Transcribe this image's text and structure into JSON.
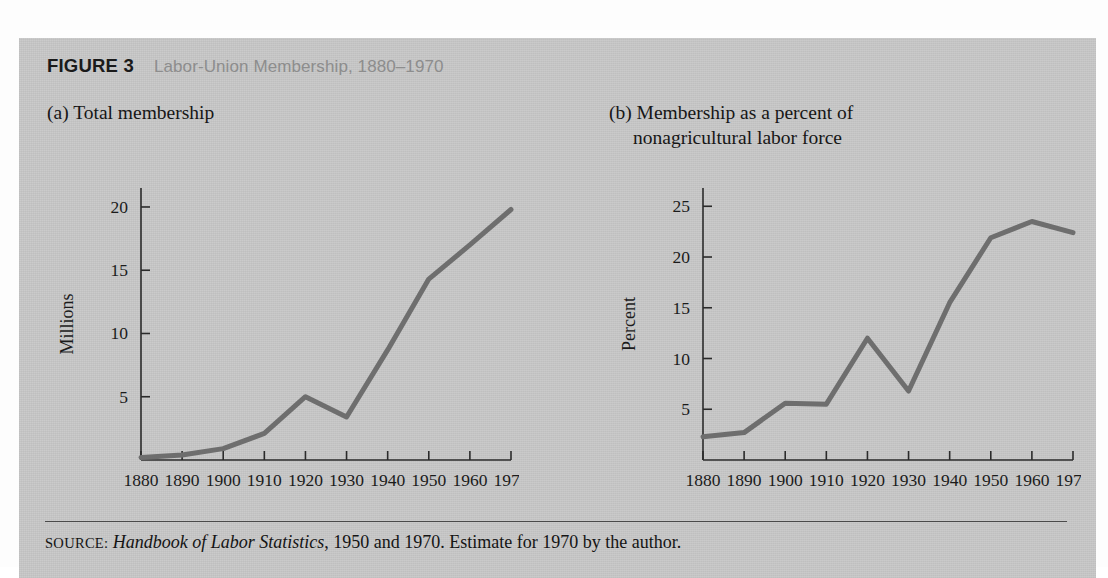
{
  "figure": {
    "label": "FIGURE 3",
    "title": "Labor-Union Membership, 1880–1970",
    "panel_a_caption": "(a) Total membership",
    "panel_b_caption_line1": "(b) Membership as a percent of",
    "panel_b_caption_line2": "nonagricultural labor force",
    "source_kicker": "SOURCE:",
    "source_italic": "Handbook of Labor Statistics",
    "source_rest": ", 1950 and 1970. Estimate for 1970 by the author.",
    "background_color": "#c9c9c9",
    "line_color": "#6e6e6e",
    "axis_color": "#2b2b2b",
    "title_color": "#8d8d8d"
  },
  "chart_data": [
    {
      "type": "line",
      "id": "total-membership",
      "title": "(a) Total membership",
      "xlabel": "",
      "ylabel": "Millions",
      "x": [
        1880,
        1890,
        1900,
        1910,
        1920,
        1930,
        1940,
        1950,
        1960,
        1970
      ],
      "values": [
        0.2,
        0.4,
        0.9,
        2.1,
        5.0,
        3.4,
        8.7,
        14.3,
        17.0,
        19.8
      ],
      "xticks": [
        "1880",
        "1890",
        "1900",
        "1910",
        "1920",
        "1930",
        "1940",
        "1950",
        "1960",
        "1970"
      ],
      "yticks": [
        5,
        10,
        15,
        20
      ],
      "ytick_labels": [
        "5",
        "10",
        "15",
        "20"
      ],
      "xlim": [
        1880,
        1970
      ],
      "ylim": [
        0,
        21.5
      ],
      "grid": false,
      "legend": "none"
    },
    {
      "type": "line",
      "id": "membership-percent",
      "title": "(b) Membership as a percent of nonagricultural labor force",
      "xlabel": "",
      "ylabel": "Percent",
      "x": [
        1880,
        1890,
        1900,
        1910,
        1920,
        1930,
        1940,
        1950,
        1960,
        1970
      ],
      "values": [
        2.3,
        2.7,
        5.6,
        5.5,
        12.0,
        6.8,
        15.5,
        21.9,
        23.5,
        22.4
      ],
      "xticks": [
        "1880",
        "1890",
        "1900",
        "1910",
        "1920",
        "1930",
        "1940",
        "1950",
        "1960",
        "1970"
      ],
      "yticks": [
        5,
        10,
        15,
        20,
        25
      ],
      "ytick_labels": [
        "5",
        "10",
        "15",
        "20",
        "25"
      ],
      "xlim": [
        1880,
        1970
      ],
      "ylim": [
        0,
        26.8
      ],
      "grid": false,
      "legend": "none"
    }
  ]
}
